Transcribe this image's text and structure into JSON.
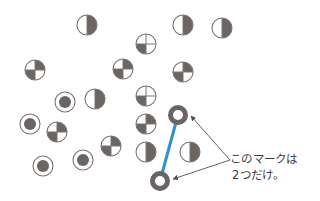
{
  "colors": {
    "dark": "#6b6563",
    "stroke": "#7a7472",
    "ring": "#6a6462",
    "line": "#2f8fd0",
    "arrow": "#555050",
    "text": "#3c3a3a"
  },
  "symbols": {
    "half_right_dark": [
      [
        87,
        25
      ],
      [
        183,
        25
      ],
      [
        222,
        28
      ],
      [
        95,
        99
      ],
      [
        146,
        152
      ],
      [
        190,
        152
      ]
    ],
    "quarter_tr_bl_dark": [
      [
        35,
        70
      ],
      [
        123,
        69
      ],
      [
        183,
        72
      ],
      [
        57,
        132
      ],
      [
        111,
        146
      ],
      [
        146,
        124
      ]
    ],
    "quarter_bl_dark": [
      [
        146,
        44
      ],
      [
        146,
        96
      ]
    ],
    "dot_in_ring": [
      [
        65,
        102
      ],
      [
        30,
        124
      ],
      [
        43,
        166
      ],
      [
        83,
        160
      ]
    ],
    "thick_ring": [
      [
        178,
        115
      ],
      [
        160,
        181
      ]
    ]
  },
  "connector": {
    "from": [
      178,
      115
    ],
    "to": [
      160,
      181
    ]
  },
  "annotation": {
    "line1": "このマークは",
    "line2": "2つだけ。",
    "arrow_origin": [
      230,
      160
    ],
    "arrow_targets": [
      [
        191,
        116
      ],
      [
        173,
        179
      ]
    ]
  }
}
